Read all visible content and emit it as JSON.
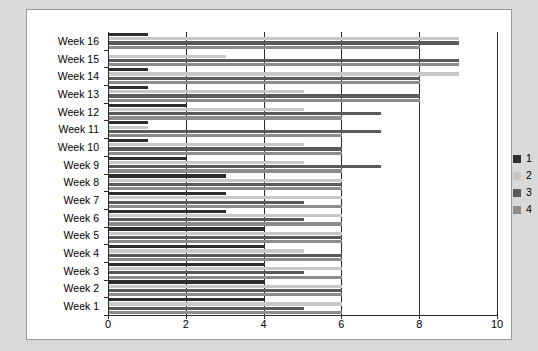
{
  "chart_data": {
    "type": "bar",
    "orientation": "horizontal",
    "title": "",
    "xlabel": "",
    "ylabel": "",
    "xlim": [
      0,
      10
    ],
    "xticks": [
      0,
      2,
      4,
      6,
      8,
      10
    ],
    "grid": true,
    "legend_position": "right",
    "categories": [
      "Week 16",
      "Week 15",
      "Week 14",
      "Week 13",
      "Week 12",
      "Week 11",
      "Week 10",
      "Week 9",
      "Week 8",
      "Week 7",
      "Week 6",
      "Week 5",
      "Week 4",
      "Week 3",
      "Week 2",
      "Week 1"
    ],
    "series": [
      {
        "name": "1",
        "color": "#2e2e2e",
        "values": [
          1,
          0,
          1,
          1,
          2,
          1,
          1,
          2,
          3,
          3,
          3,
          4,
          4,
          4,
          4,
          4
        ]
      },
      {
        "name": "2",
        "color": "#c8c8c8",
        "values": [
          9,
          3,
          9,
          5,
          5,
          1,
          5,
          5,
          6,
          6,
          6,
          6,
          5,
          6,
          6,
          6
        ]
      },
      {
        "name": "3",
        "color": "#5a5a5a",
        "values": [
          9,
          9,
          8,
          8,
          7,
          7,
          6,
          7,
          6,
          5,
          5,
          6,
          6,
          5,
          6,
          5
        ]
      },
      {
        "name": "4",
        "color": "#8c8c8c",
        "values": [
          8,
          9,
          8,
          8,
          6,
          6,
          6,
          6,
          6,
          6,
          6,
          6,
          6,
          6,
          6,
          6
        ]
      }
    ]
  },
  "legend": {
    "items": [
      {
        "label": "1",
        "color": "#2e2e2e"
      },
      {
        "label": "2",
        "color": "#c8c8c8"
      },
      {
        "label": "3",
        "color": "#5a5a5a"
      },
      {
        "label": "4",
        "color": "#8c8c8c"
      }
    ]
  }
}
